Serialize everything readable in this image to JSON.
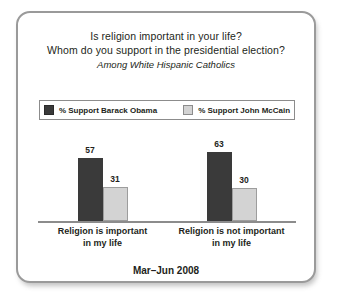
{
  "card": {
    "title_lines": [
      "Is religion important in your life?",
      "Whom do you support in the presidential election?"
    ],
    "subtitle": "Among White Hispanic Catholics",
    "footer": "Mar–Jun 2008"
  },
  "legend": {
    "items": [
      {
        "label": "% Support Barack Obama",
        "color": "#3a3a3a",
        "swatch": "legend-swatch-obama"
      },
      {
        "label": "% Support John McCain",
        "color": "#d3d3d3",
        "swatch": "legend-swatch-mccain"
      }
    ]
  },
  "chart_data": {
    "type": "bar",
    "title": "Is religion important in your life? Whom do you support in the presidential election?",
    "subtitle": "Among White Hispanic Catholics",
    "xlabel": "",
    "ylabel": "",
    "ylim": [
      0,
      100
    ],
    "grid": false,
    "legend_position": "top",
    "annotation": "Mar–Jun 2008",
    "categories": [
      "Religion is important in my life",
      "Religion is not important in my life"
    ],
    "category_lines": [
      [
        "Religion is important",
        "in my life"
      ],
      [
        "Religion is not important",
        "in my life"
      ]
    ],
    "series": [
      {
        "name": "% Support Barack Obama",
        "color": "#3a3a3a",
        "values": [
          57,
          63
        ]
      },
      {
        "name": "% Support John McCain",
        "color": "#d3d3d3",
        "values": [
          31,
          30
        ]
      }
    ]
  },
  "colors": {
    "obama": "#3a3a3a",
    "mccain": "#d3d3d3",
    "border": "#9a9a9a",
    "axis": "#8c8c8c",
    "text": "#231f20"
  }
}
